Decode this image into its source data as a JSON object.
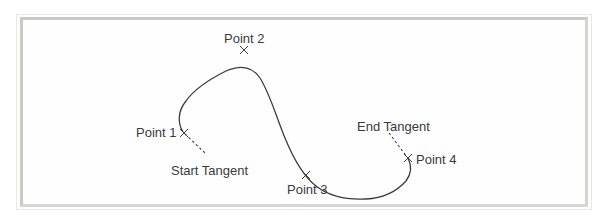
{
  "diagram": {
    "type": "spline-through-points",
    "points": [
      {
        "id": "point-1",
        "label": "Point 1",
        "x": 184,
        "y": 133
      },
      {
        "id": "point-2",
        "label": "Point 2",
        "x": 244,
        "y": 50
      },
      {
        "id": "point-3",
        "label": "Point 3",
        "x": 306,
        "y": 175
      },
      {
        "id": "point-4",
        "label": "Point 4",
        "x": 408,
        "y": 158
      }
    ],
    "tangents": {
      "start": {
        "label": "Start Tangent"
      },
      "end": {
        "label": "End Tangent"
      }
    },
    "colors": {
      "curve": "#3c3c3c",
      "text": "#3a3a3a",
      "frame": "#c9cac6",
      "background": "#ffffff"
    }
  }
}
